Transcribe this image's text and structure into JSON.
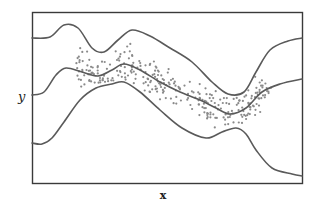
{
  "chart_data": {
    "type": "scatter",
    "title": "",
    "xlabel": "x",
    "ylabel": "y",
    "grid": false,
    "legend": null,
    "ticks": {
      "x": [],
      "y": []
    },
    "series": [
      {
        "name": "upper-band",
        "kind": "line",
        "points": [
          [
            32,
            38
          ],
          [
            50,
            37
          ],
          [
            64,
            25
          ],
          [
            78,
            28
          ],
          [
            92,
            48
          ],
          [
            104,
            52
          ],
          [
            118,
            40
          ],
          [
            132,
            30
          ],
          [
            150,
            36
          ],
          [
            170,
            48
          ],
          [
            192,
            62
          ],
          [
            212,
            82
          ],
          [
            228,
            94
          ],
          [
            244,
            92
          ],
          [
            256,
            72
          ],
          [
            270,
            50
          ],
          [
            288,
            41
          ],
          [
            302,
            38
          ]
        ]
      },
      {
        "name": "mean-fit",
        "kind": "line",
        "points": [
          [
            32,
            95
          ],
          [
            44,
            92
          ],
          [
            56,
            75
          ],
          [
            66,
            68
          ],
          [
            82,
            72
          ],
          [
            98,
            76
          ],
          [
            112,
            70
          ],
          [
            124,
            64
          ],
          [
            140,
            70
          ],
          [
            160,
            82
          ],
          [
            180,
            92
          ],
          [
            200,
            100
          ],
          [
            216,
            108
          ],
          [
            230,
            114
          ],
          [
            246,
            108
          ],
          [
            262,
            92
          ],
          [
            280,
            84
          ],
          [
            302,
            79
          ]
        ]
      },
      {
        "name": "lower-band",
        "kind": "line",
        "points": [
          [
            32,
            143
          ],
          [
            42,
            144
          ],
          [
            52,
            138
          ],
          [
            64,
            122
          ],
          [
            80,
            100
          ],
          [
            96,
            88
          ],
          [
            112,
            84
          ],
          [
            124,
            82
          ],
          [
            140,
            92
          ],
          [
            160,
            110
          ],
          [
            182,
            128
          ],
          [
            206,
            138
          ],
          [
            222,
            132
          ],
          [
            236,
            128
          ],
          [
            246,
            134
          ],
          [
            256,
            150
          ],
          [
            272,
            168
          ],
          [
            292,
            174
          ],
          [
            302,
            176
          ]
        ]
      },
      {
        "name": "observations",
        "kind": "scatter",
        "x_range": [
          76,
          272
        ],
        "y_center_follows": "mean-fit",
        "spread_px": 18,
        "count": 300
      }
    ]
  },
  "labels": {
    "x": "x",
    "y": "y"
  },
  "colors": {
    "frame": "#3a3a3a",
    "curve": "#5a5a5a",
    "points": "#8a8a8a"
  }
}
